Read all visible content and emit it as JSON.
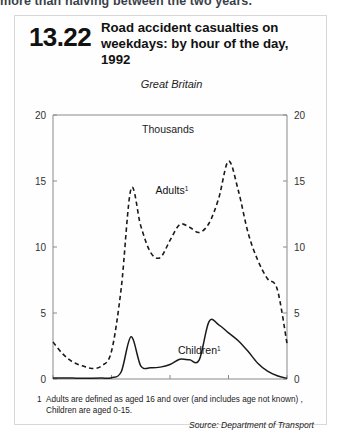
{
  "page": {
    "top_partial_text": "more than halving between the two years."
  },
  "panel": {
    "figure_number": "13.22",
    "title": "Road accident casualties on weekdays: by hour of the day, 1992",
    "title_line1": "Road accident casualties on",
    "title_line2": "weekdays: by hour of the day, 1992",
    "subtitle": "Great Britain",
    "footnote_marker": "1",
    "footnote_line1": "Adults are defined as aged 16 and over (and includes age not known) ,",
    "footnote_line2": "Children are aged 0-15.",
    "source": "Source: Department of Transport"
  },
  "chart_data": {
    "type": "line",
    "title": "Road accident casualties on weekdays: by hour of the day, 1992",
    "subtitle": "Great Britain",
    "unit_label": "Thousands",
    "xlabel": "",
    "ylabel": "Thousands",
    "ylim": [
      0,
      20
    ],
    "yticks": [
      0,
      5,
      10,
      15,
      20
    ],
    "ytick_labels": [
      "0",
      "5",
      "10",
      "15",
      "20"
    ],
    "dual_y_axis": true,
    "grid": false,
    "legend": "inline-annotations",
    "xlim": [
      0,
      24
    ],
    "xticks": [
      0,
      6,
      12,
      18,
      24
    ],
    "xtick_labels": [
      "Midnight",
      "6am",
      "Noon",
      "6pm",
      "Midnight"
    ],
    "x": [
      0,
      1,
      2,
      3,
      4,
      5,
      6,
      7,
      8,
      9,
      10,
      11,
      12,
      13,
      14,
      15,
      16,
      17,
      18,
      19,
      20,
      21,
      22,
      23,
      24
    ],
    "series": [
      {
        "name": "Adults",
        "label": "Adults",
        "label_superscript": "1",
        "style": "dashed",
        "color": "#1a1a1a",
        "values": [
          2.8,
          1.9,
          1.3,
          1.0,
          0.8,
          1.0,
          2.1,
          6.9,
          14.4,
          11.6,
          9.6,
          9.2,
          10.5,
          11.7,
          11.5,
          11.1,
          11.8,
          13.7,
          16.5,
          14.3,
          11.1,
          9.0,
          7.6,
          6.8,
          2.7
        ]
      },
      {
        "name": "Children",
        "label": "Children",
        "label_superscript": "1",
        "style": "solid",
        "color": "#1a1a1a",
        "values": [
          0.08,
          0.08,
          0.07,
          0.06,
          0.06,
          0.07,
          0.1,
          0.55,
          3.2,
          1.0,
          0.85,
          0.9,
          1.1,
          1.5,
          1.45,
          1.45,
          4.35,
          4.1,
          3.5,
          2.9,
          2.1,
          1.2,
          0.6,
          0.25,
          0.05
        ]
      }
    ],
    "annotations": [
      {
        "text": "Thousands",
        "x": 11.8,
        "y": 18.6
      },
      {
        "text": "Adults",
        "x": 12.2,
        "y": 14.0
      },
      {
        "text": "Children",
        "x": 15.0,
        "y": 1.9
      }
    ]
  }
}
